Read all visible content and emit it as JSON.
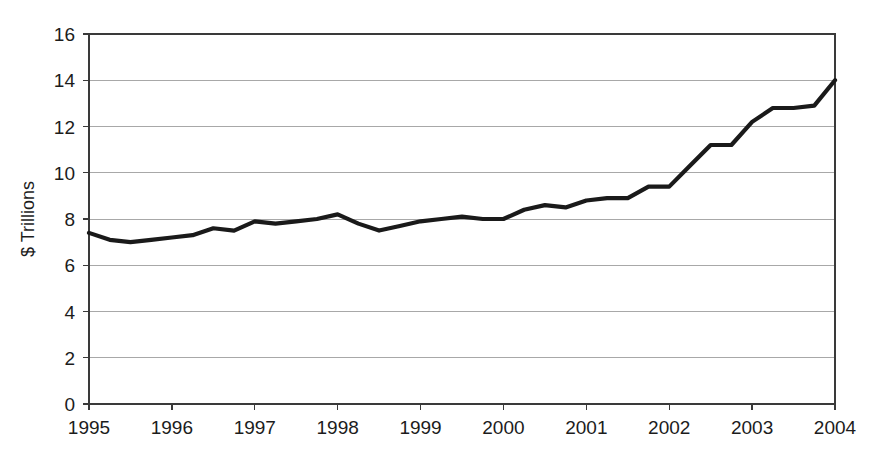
{
  "chart_data": {
    "type": "line",
    "title": "",
    "xlabel": "",
    "ylabel": "$ Trillions",
    "xlim": [
      1995,
      2004
    ],
    "ylim": [
      0,
      16
    ],
    "ytick_step": 2,
    "grid": true,
    "legend": "none",
    "line_color": "#1a1a1a",
    "grid_color": "#a8a8a8",
    "frame_color": "#3a3a3a",
    "background": "#ffffff",
    "ytick_labels": [
      "0",
      "2",
      "4",
      "6",
      "8",
      "10",
      "12",
      "14",
      "16"
    ],
    "ytick_values": [
      0,
      2,
      4,
      6,
      8,
      10,
      12,
      14,
      16
    ],
    "xtick_labels": [
      "1995",
      "1996",
      "1997",
      "1998",
      "1999",
      "2000",
      "2001",
      "2002",
      "2003",
      "2004"
    ],
    "xtick_values": [
      1995,
      1996,
      1997,
      1998,
      1999,
      2000,
      2001,
      2002,
      2003,
      2004
    ],
    "series": [
      {
        "name": "value",
        "x": [
          1995.0,
          1995.25,
          1995.5,
          1995.75,
          1996.0,
          1996.25,
          1996.5,
          1996.75,
          1997.0,
          1997.25,
          1997.5,
          1997.75,
          1998.0,
          1998.25,
          1998.5,
          1998.75,
          1999.0,
          1999.25,
          1999.5,
          1999.75,
          2000.0,
          2000.25,
          2000.5,
          2000.75,
          2001.0,
          2001.25,
          2001.5,
          2001.75,
          2002.0,
          2002.25,
          2002.5,
          2002.75,
          2003.0,
          2003.25,
          2003.5,
          2003.75,
          2004.0
        ],
        "y": [
          7.4,
          7.1,
          7.0,
          7.1,
          7.2,
          7.3,
          7.6,
          7.5,
          7.9,
          7.8,
          7.9,
          8.0,
          8.2,
          7.8,
          7.5,
          7.7,
          7.9,
          8.0,
          8.1,
          8.0,
          8.0,
          8.4,
          8.6,
          8.5,
          8.8,
          8.9,
          8.9,
          9.4,
          9.4,
          10.3,
          11.2,
          11.2,
          12.2,
          12.8,
          12.8,
          12.9,
          14.0
        ]
      }
    ]
  },
  "plot_geometry": {
    "left": 89,
    "right": 835,
    "top": 34,
    "bottom": 404
  }
}
